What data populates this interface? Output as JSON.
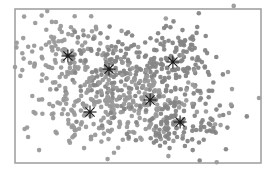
{
  "chart_data": {
    "type": "scatter",
    "title": "",
    "xlabel": "",
    "ylabel": "",
    "xlim": [
      0,
      1
    ],
    "ylim": [
      0,
      1
    ],
    "grid": false,
    "legend": null,
    "axis_ticks": false,
    "frame": {
      "left": 15,
      "top": 9,
      "right": 261,
      "bottom": 163,
      "color": "#9c9c9c",
      "width": 1.5
    },
    "point_style": {
      "radius": 2.3,
      "colors": [
        "#9a9a9a",
        "#858585"
      ],
      "opacity": 0.95
    },
    "centroid_style": {
      "marker": "asterisk",
      "color": "#1a1a1a",
      "size": 6.5
    },
    "series": [
      {
        "name": "cluster-1",
        "center": [
          0.215,
          0.305
        ],
        "spread": [
          0.11,
          0.13
        ],
        "count": 130,
        "shade": 0
      },
      {
        "name": "cluster-2",
        "center": [
          0.382,
          0.39
        ],
        "spread": [
          0.1,
          0.12
        ],
        "count": 130,
        "shade": 1
      },
      {
        "name": "cluster-3",
        "center": [
          0.642,
          0.344
        ],
        "spread": [
          0.09,
          0.13
        ],
        "count": 140,
        "shade": 1
      },
      {
        "name": "cluster-4",
        "center": [
          0.549,
          0.591
        ],
        "spread": [
          0.11,
          0.12
        ],
        "count": 140,
        "shade": 0
      },
      {
        "name": "cluster-5",
        "center": [
          0.305,
          0.669
        ],
        "spread": [
          0.12,
          0.12
        ],
        "count": 140,
        "shade": 0
      },
      {
        "name": "cluster-6",
        "center": [
          0.671,
          0.734
        ],
        "spread": [
          0.1,
          0.11
        ],
        "count": 120,
        "shade": 1
      }
    ],
    "centroids": [
      {
        "x": 0.215,
        "y": 0.305
      },
      {
        "x": 0.382,
        "y": 0.39
      },
      {
        "x": 0.642,
        "y": 0.344
      },
      {
        "x": 0.549,
        "y": 0.591
      },
      {
        "x": 0.305,
        "y": 0.669
      },
      {
        "x": 0.671,
        "y": 0.734
      }
    ],
    "outliers": [
      {
        "x": 0.613,
        "y": 0.062
      },
      {
        "x": 0.889,
        "y": -0.02
      },
      {
        "x": 0.0,
        "y": 0.377
      },
      {
        "x": 0.866,
        "y": 0.409
      },
      {
        "x": 0.882,
        "y": 0.52
      },
      {
        "x": 0.992,
        "y": 0.578
      },
      {
        "x": 0.87,
        "y": 0.675
      },
      {
        "x": 0.878,
        "y": 0.62
      },
      {
        "x": 0.098,
        "y": 0.916
      },
      {
        "x": 0.039,
        "y": 0.779
      },
      {
        "x": 0.82,
        "y": 0.995
      },
      {
        "x": 0.22,
        "y": 0.855
      }
    ]
  }
}
